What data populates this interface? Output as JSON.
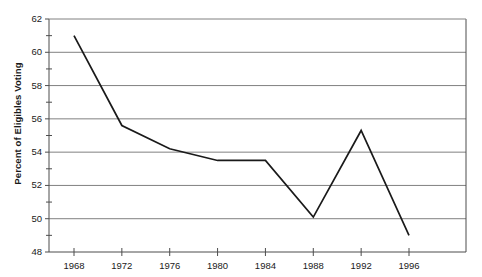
{
  "chart_data": {
    "type": "line",
    "title": "",
    "xlabel": "",
    "ylabel": "Percent of Eligibles Voting",
    "x": [
      1968,
      1972,
      1976,
      1980,
      1984,
      1988,
      1992,
      1996
    ],
    "categories": [
      "1968",
      "1972",
      "1976",
      "1980",
      "1984",
      "1988",
      "1992",
      "1996"
    ],
    "values": [
      61.0,
      55.6,
      54.2,
      53.5,
      53.5,
      50.1,
      55.3,
      49.0
    ],
    "series": [
      {
        "name": "Percent of Eligibles Voting",
        "values": [
          61.0,
          55.6,
          54.2,
          53.5,
          53.5,
          50.1,
          55.3,
          49.0
        ]
      }
    ],
    "xlim": [
      1966,
      1998
    ],
    "ylim": [
      48,
      62
    ],
    "y_major_ticks": [
      48,
      50,
      52,
      54,
      56,
      58,
      60,
      62
    ],
    "y_minor_ticks": [
      49,
      51,
      53,
      55,
      57,
      59,
      61
    ],
    "y_tick_labels": [
      "48",
      "50",
      "52",
      "54",
      "56",
      "58",
      "60",
      "62"
    ],
    "x_tick_labels": [
      "1968",
      "1972",
      "1976",
      "1980",
      "1984",
      "1988",
      "1992",
      "1996"
    ],
    "grid": "horizontal-major-only",
    "legend": "none",
    "line_color": "#1a1a1a",
    "grid_color": "#808080",
    "axis_color": "#4d4d4d",
    "background": "#ffffff"
  },
  "axes": {
    "y_title": "Percent of Eligibles Voting"
  },
  "artifacts": {
    "cropped_title_fragment": ""
  }
}
